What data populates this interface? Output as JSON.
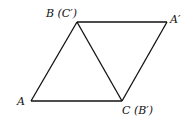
{
  "diagram": {
    "type": "geometry",
    "points": {
      "A": {
        "x": 31,
        "y": 101,
        "label": "A"
      },
      "B": {
        "x": 77,
        "y": 22,
        "label": "B (C′)"
      },
      "A_prime": {
        "x": 167,
        "y": 22,
        "label": "A′"
      },
      "C": {
        "x": 122,
        "y": 101,
        "label": "C (B′)"
      }
    },
    "edges": [
      [
        "A",
        "B"
      ],
      [
        "B",
        "A_prime"
      ],
      [
        "A_prime",
        "C"
      ],
      [
        "C",
        "A"
      ],
      [
        "B",
        "C"
      ]
    ],
    "colors": {
      "stroke": "#111111",
      "background": "#ffffff"
    }
  }
}
